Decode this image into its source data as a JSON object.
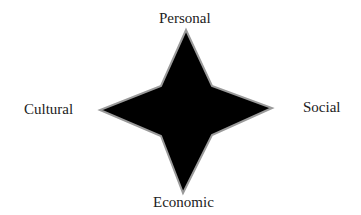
{
  "diagram": {
    "shape": "four-pointed-star",
    "fill_color": "#000000",
    "stroke_color": "#9a9a9a",
    "labels": {
      "top": "Personal",
      "left": "Cultural",
      "right": "Social",
      "bottom": "Economic"
    }
  }
}
